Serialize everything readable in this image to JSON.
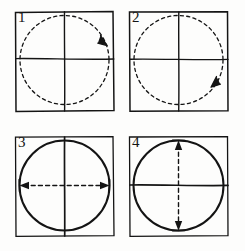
{
  "figure": {
    "type": "four-panel-line-drawing",
    "background_color": "#fdfdfc",
    "ink_color": "#141414",
    "panel_count": 4,
    "grid": {
      "rows": 2,
      "columns": 2
    }
  },
  "panels": [
    {
      "label": "1",
      "frame_style": "solid",
      "circle_style": "dashed",
      "vertical_line_style": "solid",
      "horizontal_line_style": "solid",
      "arrow": {
        "kind": "curved-single",
        "direction": "clockwise",
        "position": "upper-right-arc",
        "head_count": 1,
        "line_style": "dashed"
      }
    },
    {
      "label": "2",
      "frame_style": "solid",
      "circle_style": "dashed",
      "vertical_line_style": "solid",
      "horizontal_line_style": "solid",
      "arrow": {
        "kind": "curved-single",
        "direction": "counterclockwise",
        "position": "lower-right-arc",
        "head_count": 1,
        "line_style": "dashed"
      }
    },
    {
      "label": "3",
      "frame_style": "solid",
      "circle_style": "solid",
      "vertical_line_style": "solid",
      "horizontal_line_style": "dashed-arrow",
      "arrow": {
        "kind": "straight-double",
        "direction": "horizontal",
        "position": "horizontal-diameter",
        "head_count": 2,
        "line_style": "dashed"
      }
    },
    {
      "label": "4",
      "frame_style": "solid",
      "circle_style": "solid",
      "vertical_line_style": "dashed-arrow",
      "horizontal_line_style": "solid",
      "arrow": {
        "kind": "straight-double",
        "direction": "vertical",
        "position": "vertical-diameter",
        "head_count": 2,
        "line_style": "dashed"
      }
    }
  ]
}
